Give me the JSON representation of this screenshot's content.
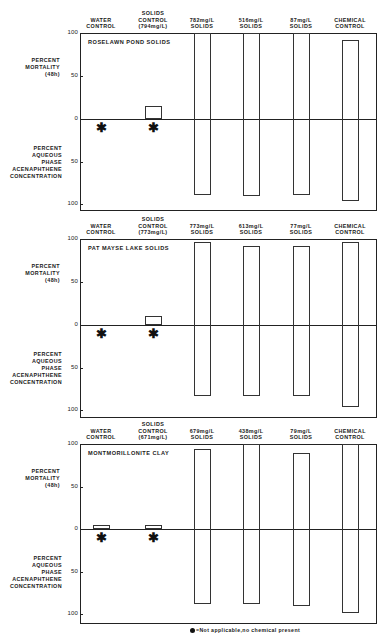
{
  "chart_data": [
    {
      "type": "bar",
      "title": "ROSELAWN POND SOLIDS",
      "categories": [
        "WATER CONTROL",
        "SOLIDS CONTROL (794mg/L)",
        "782mg/L SOLIDS",
        "516mg/L SOLIDS",
        "87mg/L SOLIDS",
        "CHEMICAL CONTROL"
      ],
      "series": [
        {
          "name": "PERCENT MORTALITY (48h)",
          "direction": "up",
          "values": [
            0,
            15,
            100,
            100,
            100,
            92
          ]
        },
        {
          "name": "PERCENT AQUEOUS PHASE ACENAPHTHENE CONCENTRATION",
          "direction": "down",
          "values": [
            null,
            null,
            89,
            91,
            89,
            96
          ]
        }
      ],
      "not_applicable": [
        0,
        1
      ],
      "ylabel_upper": "PERCENT MORTALITY (48h)",
      "ylabel_lower": "PERCENT AQUEOUS PHASE ACENAPHTHENE CONCENTRATION",
      "yticks": [
        "100",
        "50",
        "0",
        "50",
        "100"
      ],
      "ylim": [
        0,
        100
      ],
      "grid": false
    },
    {
      "type": "bar",
      "title": "PAT MAYSE LAKE SOLIDS",
      "categories": [
        "WATER CONTROL",
        "SOLIDS CONTROL (773mg/L)",
        "773mg/L SOLIDS",
        "613mg/L SOLIDS",
        "77mg/L SOLIDS",
        "CHEMICAL CONTROL"
      ],
      "series": [
        {
          "name": "PERCENT MORTALITY (48h)",
          "direction": "up",
          "values": [
            0,
            11,
            96,
            92,
            92,
            97
          ]
        },
        {
          "name": "PERCENT AQUEOUS PHASE ACENAPHTHENE CONCENTRATION",
          "direction": "down",
          "values": [
            null,
            null,
            83,
            84,
            83,
            96
          ]
        }
      ],
      "not_applicable": [
        0,
        1
      ],
      "ylabel_upper": "PERCENT MORTALITY (48h)",
      "ylabel_lower": "PERCENT AQUEOUS PHASE ACENAPHTHENE CONCENTRATION",
      "yticks": [
        "100",
        "50",
        "0",
        "50",
        "100"
      ],
      "ylim": [
        0,
        100
      ],
      "grid": false
    },
    {
      "type": "bar",
      "title": "MONTMORILLONITE CLAY",
      "categories": [
        "WATER CONTROL",
        "SOLIDS CONTROL (671mg/L)",
        "679mg/L SOLIDS",
        "438mg/L SOLIDS",
        "79mg/L SOLIDS",
        "CHEMICAL CONTROL"
      ],
      "series": [
        {
          "name": "PERCENT MORTALITY (48h)",
          "direction": "up",
          "values": [
            5,
            5,
            94,
            100,
            89,
            100
          ]
        },
        {
          "name": "PERCENT AQUEOUS PHASE ACENAPHTHENE CONCENTRATION",
          "direction": "down",
          "values": [
            null,
            null,
            88,
            88,
            91,
            99
          ]
        }
      ],
      "not_applicable": [
        0,
        1
      ],
      "ylabel_upper": "PERCENT MORTALITY (48h)",
      "ylabel_lower": "PERCENT AQUEOUS PHASE ACENAPHTHENE CONCENTRATION",
      "yticks": [
        "100",
        "50",
        "0",
        "50",
        "100"
      ],
      "ylim": [
        0,
        100
      ],
      "grid": false
    }
  ],
  "panels": [
    {
      "title": "ROSELAWN POND SOLIDS",
      "columns": [
        {
          "line1": "",
          "line2": "WATER",
          "line3": "CONTROL"
        },
        {
          "line1": "SOLIDS",
          "line2": "CONTROL",
          "line3": "(794mg/L)"
        },
        {
          "line1": "",
          "line2": "782mg/L",
          "line3": "SOLIDS"
        },
        {
          "line1": "",
          "line2": "516mg/L",
          "line3": "SOLIDS"
        },
        {
          "line1": "",
          "line2": "87mg/L",
          "line3": "SOLIDS"
        },
        {
          "line1": "",
          "line2": "CHEMICAL",
          "line3": "CONTROL"
        }
      ]
    },
    {
      "title": "PAT MAYSE LAKE SOLIDS",
      "columns": [
        {
          "line1": "",
          "line2": "WATER",
          "line3": "CONTROL"
        },
        {
          "line1": "SOLIDS",
          "line2": "CONTROL",
          "line3": "(773mg/L)"
        },
        {
          "line1": "",
          "line2": "773mg/L",
          "line3": "SOLIDS"
        },
        {
          "line1": "",
          "line2": "613mg/L",
          "line3": "SOLIDS"
        },
        {
          "line1": "",
          "line2": "77mg/L",
          "line3": "SOLIDS"
        },
        {
          "line1": "",
          "line2": "CHEMICAL",
          "line3": "CONTROL"
        }
      ]
    },
    {
      "title": "MONTMORILLONITE CLAY",
      "columns": [
        {
          "line1": "",
          "line2": "WATER",
          "line3": "CONTROL"
        },
        {
          "line1": "SOLIDS",
          "line2": "CONTROL",
          "line3": "(671mg/L)"
        },
        {
          "line1": "",
          "line2": "679mg/L",
          "line3": "SOLIDS"
        },
        {
          "line1": "",
          "line2": "438mg/L",
          "line3": "SOLIDS"
        },
        {
          "line1": "",
          "line2": "79mg/L",
          "line3": "SOLIDS"
        },
        {
          "line1": "",
          "line2": "CHEMICAL",
          "line3": "CONTROL"
        }
      ]
    }
  ],
  "axis": {
    "upper_label": [
      "PERCENT",
      "MORTALITY",
      "(48h)"
    ],
    "lower_label": [
      "PERCENT",
      "AQUEOUS",
      "PHASE",
      "ACENAPHTHENE",
      "CONCENTRATION"
    ],
    "ticks": {
      "t100": "100",
      "t50": "50",
      "t0": "0"
    }
  },
  "footnote": "=Not applicable,no chemical present",
  "star_glyph": "✱"
}
